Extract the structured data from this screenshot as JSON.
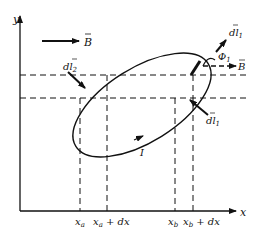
{
  "diagram": {
    "axes": {
      "x_label": "x",
      "y_label": "y"
    },
    "field": {
      "label": "B",
      "vector": true
    },
    "current": {
      "label": "I"
    },
    "elements": {
      "dl1_label": "dl",
      "dl1_sub": "1",
      "dl2_label": "dl",
      "dl2_sub": "2",
      "dl1_lower_label": "dl",
      "dl1_lower_sub": "1",
      "angle_label": "Φ",
      "angle_sub": "1",
      "B_small_label": "B"
    },
    "x_ticks": [
      {
        "base": "x",
        "sub": "a",
        "suffix": ""
      },
      {
        "base": "x",
        "sub": "a",
        "suffix": " + dx"
      },
      {
        "base": "x",
        "sub": "b",
        "suffix": ""
      },
      {
        "base": "x",
        "sub": "b",
        "suffix": " + dx"
      }
    ],
    "colors": {
      "line": "#111111",
      "background": "#ffffff"
    }
  }
}
